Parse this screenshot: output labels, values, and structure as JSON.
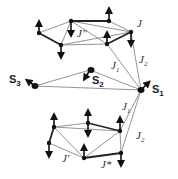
{
  "diagram": {
    "spins": [
      {
        "id": "S1",
        "label": "S",
        "sub": "1"
      },
      {
        "id": "S2",
        "label": "S",
        "sub": "2"
      },
      {
        "id": "S3",
        "label": "S",
        "sub": "3"
      }
    ],
    "couplings": {
      "J": "J",
      "J_dprime": "J\"",
      "J1_top": {
        "label": "J",
        "sub": "1"
      },
      "J2_top": {
        "label": "J",
        "sub": "2"
      },
      "J1_bottom": {
        "label": "J",
        "sub": "1"
      },
      "J2_bottom": {
        "label": "J",
        "sub": "2"
      },
      "J_prime": "J'",
      "J_star": "J*"
    },
    "colors": {
      "thick_bond": "#222222",
      "thin_bond": "#888888",
      "node": "#111111"
    }
  }
}
